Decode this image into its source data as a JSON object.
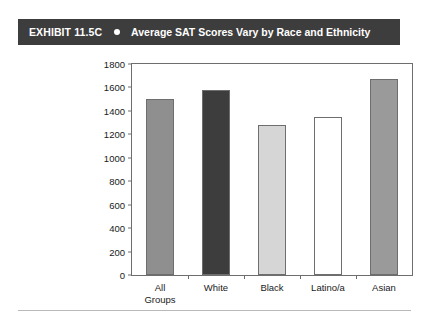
{
  "header": {
    "exhibit_label": "EXHIBIT 11.5C",
    "bullet_icon": "bullet-dot-icon",
    "title": "Average SAT Scores Vary by Race and Ethnicity",
    "background_color": "#3d3d3d",
    "text_color": "#ffffff"
  },
  "chart_data": {
    "type": "bar",
    "title": "Average SAT Scores Vary by Race and Ethnicity",
    "xlabel": "",
    "ylabel": "",
    "ylim": [
      0,
      1800
    ],
    "ytick_step": 200,
    "yticks": [
      0,
      200,
      400,
      600,
      800,
      1000,
      1200,
      1400,
      1600,
      1800
    ],
    "ytick_labels": [
      "0",
      "200",
      "400",
      "600",
      "800",
      "1000",
      "1200",
      "1400",
      "1600",
      "1800"
    ],
    "grid": false,
    "legend": "none",
    "categories": [
      "All\nGroups",
      "White",
      "Black",
      "Latino/a",
      "Asian"
    ],
    "category_labels": [
      "All Groups",
      "White",
      "Black",
      "Latino/a",
      "Asian"
    ],
    "values": [
      1500,
      1580,
      1280,
      1350,
      1670
    ],
    "bar_colors": [
      "#8f8f8f",
      "#3d3d3d",
      "#d6d6d6",
      "#ffffff",
      "#9a9a9a"
    ],
    "bar_edge_color": "#6e6e6e",
    "axis_color": "#6e6e6e"
  }
}
